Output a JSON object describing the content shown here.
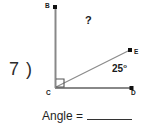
{
  "problem": {
    "number_label": "7 )",
    "answer_prompt": "Angle =",
    "answer_value": ""
  },
  "figure": {
    "type": "angle-diagram",
    "points": [
      {
        "name": "B",
        "label": "B",
        "x": 55,
        "y": 7
      },
      {
        "name": "C",
        "label": "C",
        "x": 55,
        "y": 88
      },
      {
        "name": "D",
        "label": "D",
        "x": 133,
        "y": 88
      },
      {
        "name": "E",
        "label": "E",
        "x": 130,
        "y": 50
      }
    ],
    "segments": [
      {
        "name": "CB",
        "from": "C",
        "to": "B"
      },
      {
        "name": "CD",
        "from": "C",
        "to": "D"
      },
      {
        "name": "CE",
        "from": "C",
        "to": "E"
      }
    ],
    "angles": [
      {
        "name": "BCD",
        "label": "right-angle-marker",
        "value": "90",
        "marked": "square"
      },
      {
        "name": "BCE",
        "label": "?",
        "value": "?"
      },
      {
        "name": "ECD",
        "label": "25°",
        "value": "25",
        "unit": "degrees"
      }
    ],
    "unknown_marker": "?",
    "known_angle_text": "25",
    "degree_symbol": "o",
    "line_color": "#808080",
    "text_color": "#1a1a1a",
    "background_color": "#ffffff"
  }
}
